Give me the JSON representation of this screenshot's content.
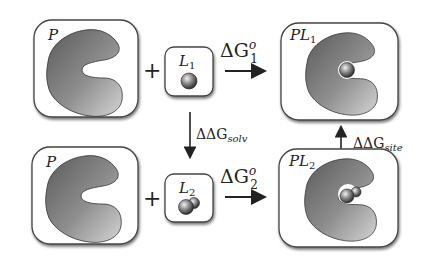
{
  "diagram": {
    "boxes": {
      "protein_top": {
        "label": "P"
      },
      "ligand1": {
        "label": "L",
        "sub": "1"
      },
      "complex1": {
        "label": "PL",
        "sub": "1"
      },
      "protein_bottom": {
        "label": "P"
      },
      "ligand2": {
        "label": "L",
        "sub": "2"
      },
      "complex2": {
        "label": "PL",
        "sub": "2"
      }
    },
    "operators": {
      "plus_top": "+",
      "plus_bottom": "+"
    },
    "arrows": {
      "binding1": {
        "delta": "ΔG",
        "sup": "o",
        "sub": "1"
      },
      "binding2": {
        "delta": "ΔG",
        "sup": "o",
        "sub": "2"
      },
      "solvation": {
        "delta": "ΔΔG",
        "sub": "solv"
      },
      "site": {
        "delta": "ΔΔG",
        "sub": "site"
      }
    },
    "colors": {
      "box_stroke": "#444444",
      "shadow": "#9a9a9a",
      "protein_dark": "#4a4a4a",
      "protein_light": "#c8c8c8",
      "ink": "#222222"
    }
  }
}
